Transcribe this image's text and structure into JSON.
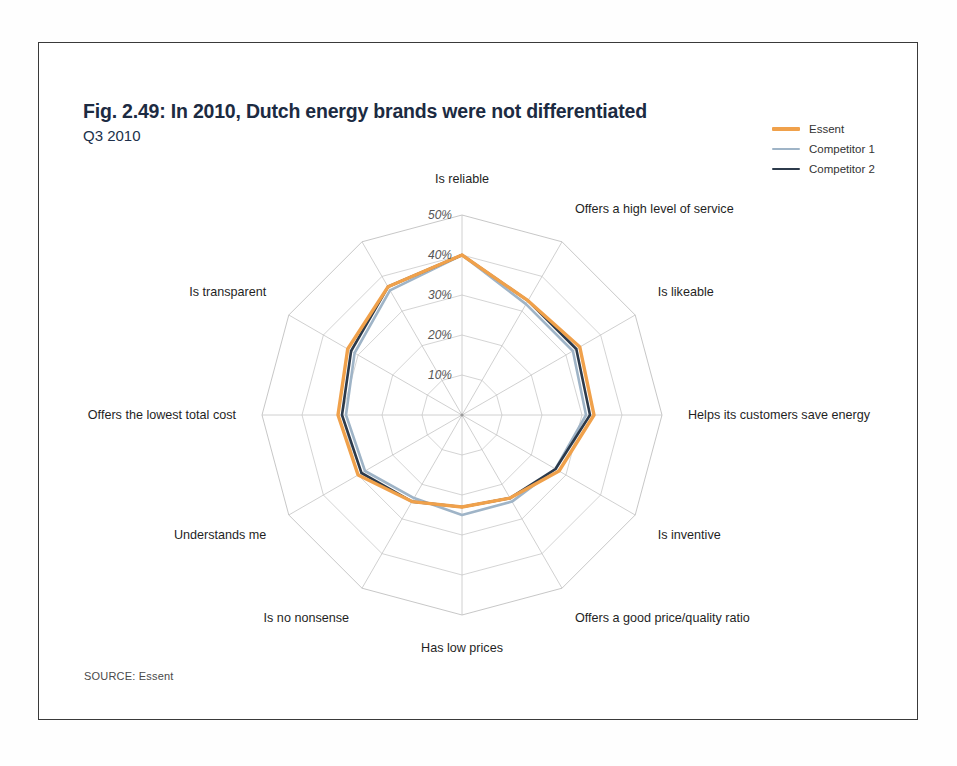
{
  "title": "Fig. 2.49: In 2010, Dutch energy brands were not differentiated",
  "subtitle": "Q3 2010",
  "source": "SOURCE: Essent",
  "legend": {
    "items": [
      {
        "label": "Essent",
        "color": "#F0A14B"
      },
      {
        "label": "Competitor 1",
        "color": "#9FB4C7"
      },
      {
        "label": "Competitor 2",
        "color": "#2C3A4B"
      }
    ]
  },
  "chart_data": {
    "type": "radar",
    "title": "Fig. 2.49: In 2010, Dutch energy brands were not differentiated",
    "subtitle": "Q3 2010",
    "categories": [
      "Is reliable",
      "Offers a high level of service",
      "Is likeable",
      "Helps its customers save energy",
      "Is inventive",
      "Offers a good price/quality ratio",
      "Has low prices",
      "Is no nonsense",
      "Understands me",
      "Offers the lowest total cost",
      "Is transparent",
      ""
    ],
    "tick_labels": [
      "10%",
      "20%",
      "30%",
      "40%",
      "50%"
    ],
    "tick_values": [
      10,
      20,
      30,
      40,
      50
    ],
    "rmax": 50,
    "rmin": 0,
    "grid": true,
    "legend_position": "top-right",
    "value_unit": "%",
    "series": [
      {
        "name": "Essent",
        "color": "#F0A14B",
        "values": [
          40,
          33,
          34,
          33,
          28,
          24,
          23,
          25,
          30,
          31,
          33,
          37
        ]
      },
      {
        "name": "Competitor 1",
        "color": "#9FB4C7",
        "values": [
          40,
          32,
          32,
          31,
          27,
          25,
          25,
          24,
          28,
          29,
          31,
          36
        ]
      },
      {
        "name": "Competitor 2",
        "color": "#2C3A4B",
        "values": [
          40,
          33,
          33,
          32,
          27,
          24,
          23,
          25,
          29,
          30,
          32,
          37
        ]
      }
    ]
  }
}
